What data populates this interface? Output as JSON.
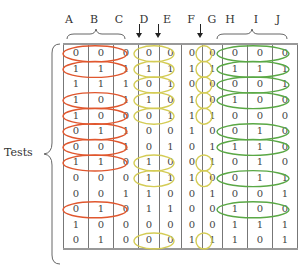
{
  "column_headers": [
    "A",
    "B",
    "C",
    "D",
    "E",
    "F",
    "G",
    "H",
    "I",
    "J"
  ],
  "arrow_markers": [
    "D",
    "E",
    "G"
  ],
  "row_group_label": "Tests",
  "group_colors": {
    "ABC": "#e0572e",
    "DEFG": "#d4cc55",
    "HIJ": "#5aa845"
  },
  "rows": [
    {
      "values": [
        0,
        0,
        0,
        0,
        0,
        0,
        0,
        0,
        0,
        0
      ],
      "circled": {
        "ABC": true,
        "DE": true,
        "G": true,
        "HIJ": true
      }
    },
    {
      "values": [
        1,
        1,
        1,
        1,
        1,
        1,
        1,
        1,
        1,
        1
      ],
      "circled": {
        "ABC": true,
        "DE": true,
        "G": true,
        "HIJ": true
      }
    },
    {
      "values": [
        1,
        1,
        1,
        0,
        1,
        0,
        0,
        0,
        0,
        1
      ],
      "circled": {
        "ABC": false,
        "DE": true,
        "G": true,
        "HIJ": true
      }
    },
    {
      "values": [
        1,
        0,
        1,
        1,
        0,
        1,
        0,
        1,
        0,
        0
      ],
      "circled": {
        "ABC": true,
        "DE": true,
        "G": true,
        "HIJ": true
      }
    },
    {
      "values": [
        1,
        0,
        0,
        0,
        1,
        1,
        1,
        0,
        0,
        0
      ],
      "circled": {
        "ABC": true,
        "DE": true,
        "G": true,
        "HIJ": false
      }
    },
    {
      "values": [
        0,
        1,
        1,
        0,
        0,
        1,
        0,
        0,
        1,
        0
      ],
      "circled": {
        "ABC": true,
        "DE": false,
        "G": false,
        "HIJ": true
      }
    },
    {
      "values": [
        0,
        0,
        1,
        0,
        1,
        0,
        1,
        1,
        1,
        0
      ],
      "circled": {
        "ABC": true,
        "DE": false,
        "G": false,
        "HIJ": true
      }
    },
    {
      "values": [
        1,
        1,
        0,
        1,
        0,
        0,
        1,
        0,
        1,
        0
      ],
      "circled": {
        "ABC": true,
        "DE": true,
        "G": true,
        "HIJ": false
      }
    },
    {
      "values": [
        0,
        0,
        0,
        1,
        1,
        1,
        0,
        0,
        1,
        1
      ],
      "circled": {
        "ABC": false,
        "DE": true,
        "G": true,
        "HIJ": true
      }
    },
    {
      "values": [
        0,
        0,
        1,
        1,
        0,
        0,
        1,
        0,
        0,
        1
      ],
      "circled": {
        "ABC": false,
        "DE": false,
        "G": false,
        "HIJ": false
      }
    },
    {
      "values": [
        0,
        1,
        0,
        1,
        1,
        0,
        0,
        1,
        0,
        0
      ],
      "circled": {
        "ABC": true,
        "DE": false,
        "G": false,
        "HIJ": true
      }
    },
    {
      "values": [
        1,
        0,
        0,
        0,
        0,
        0,
        0,
        1,
        1,
        1
      ],
      "circled": {
        "ABC": false,
        "DE": false,
        "G": false,
        "HIJ": false
      }
    },
    {
      "values": [
        0,
        1,
        0,
        0,
        0,
        1,
        1,
        1,
        0,
        1
      ],
      "circled": {
        "ABC": false,
        "DE": true,
        "G": true,
        "HIJ": false
      }
    }
  ]
}
